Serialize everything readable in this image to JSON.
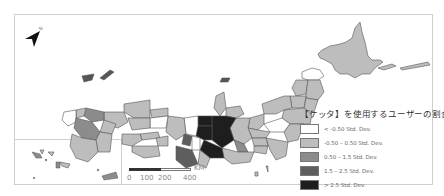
{
  "map": {
    "title": "Japan prefectures choropleth",
    "north_arrow": {
      "icon": "north-arrow-icon",
      "label": "N"
    },
    "legend": {
      "title": "【ケッタ】を使用するユーザーの割合",
      "classes": [
        {
          "label": "< -0.50 Std. Dev.",
          "color": "#ffffff"
        },
        {
          "label": "-0.50 – 0.50 Std. Dev.",
          "color": "#bdbdbd"
        },
        {
          "label": "0.50 – 1.5 Std. Dev.",
          "color": "#8c8c8c"
        },
        {
          "label": "1.5 – 2.5 Std. Dev.",
          "color": "#5e5e5e"
        },
        {
          "label": "> 2.5 Std. Dev.",
          "color": "#1e1e1e"
        }
      ]
    },
    "scale_bar": {
      "unit": "KM",
      "ticks": [
        "0",
        "100",
        "200",
        "400"
      ]
    },
    "colors": {
      "frame_border": "#cfcfcf",
      "region_outline": "#555555"
    }
  }
}
